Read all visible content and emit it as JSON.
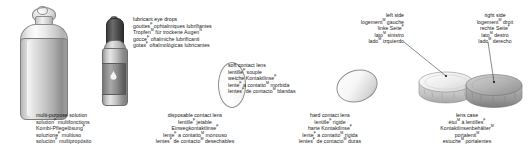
{
  "page": {
    "background": "#ffffff",
    "width": 532,
    "height": 158
  },
  "captions": [
    {
      "id": "multi-purpose-solution",
      "align": "left",
      "lines": [
        {
          "text": "multi-purpose solution",
          "lang": "en"
        },
        {
          "text": "solution",
          "sup": "F",
          "rest": " multifonctions",
          "lang": "fr"
        },
        {
          "text": "Kombi-Pflegelösung",
          "sup": "F",
          "rest": "",
          "lang": "de"
        },
        {
          "text": "soluzione",
          "sup": "F",
          "rest": " multiuso",
          "lang": "it"
        },
        {
          "text": "solución",
          "sup": "F",
          "rest": " multipropósito",
          "lang": "es"
        }
      ]
    },
    {
      "id": "lubricant-eye-drops",
      "align": "left",
      "lines": [
        {
          "text": "lubricant eye drops",
          "lang": "en"
        },
        {
          "text": "gouttes",
          "sup": "F",
          "rest": " ophtalmiques lubrifiantes",
          "lang": "fr"
        },
        {
          "text": "Tropfen",
          "sup": "M",
          "rest": " für trockene Augen",
          "sup2": "N",
          "lang": "de"
        },
        {
          "text": "gocce",
          "sup": "F",
          "rest": " oftalmiche lubrificanti",
          "lang": "it"
        },
        {
          "text": "gotas",
          "sup": "F",
          "rest": " oftalmológicas lubricantes",
          "lang": "es"
        }
      ]
    },
    {
      "id": "soft-contact-lens",
      "align": "left",
      "lines": [
        {
          "text": "soft contact lens",
          "lang": "en"
        },
        {
          "text": "lentille",
          "sup": "F",
          "rest": " souple",
          "lang": "fr"
        },
        {
          "text": "weiche Kontaktlinse",
          "sup": "F",
          "rest": "",
          "lang": "de"
        },
        {
          "text": "lente",
          "sup": "F",
          "rest": " a contatto",
          "sup2": "M",
          "rest2": " morbida",
          "lang": "it"
        },
        {
          "text": "lentes",
          "sup": "F",
          "rest": " de contacto",
          "sup2": "M",
          "rest2": " blandas",
          "lang": "es"
        }
      ]
    },
    {
      "id": "disposable-contact-lens",
      "align": "center",
      "lines": [
        {
          "text": "disposable contact lens",
          "lang": "en"
        },
        {
          "text": "lentille",
          "sup": "F",
          "rest": " jetable",
          "lang": "fr"
        },
        {
          "text": "Einwegkontaktlinse",
          "sup": "F",
          "rest": "",
          "lang": "de"
        },
        {
          "text": "lente",
          "sup": "F",
          "rest": " a contatto",
          "sup2": "M",
          "rest2": " monouso",
          "lang": "it"
        },
        {
          "text": "lentes",
          "sup": "F",
          "rest": " de contacto",
          "sup2": "M",
          "rest2": " desechables",
          "lang": "es"
        }
      ]
    },
    {
      "id": "hard-contact-lens",
      "align": "center",
      "lines": [
        {
          "text": "hard contact lens",
          "lang": "en"
        },
        {
          "text": "lentille",
          "sup": "F",
          "rest": " rigide",
          "lang": "fr"
        },
        {
          "text": "harte Kontaktlinse",
          "sup": "F",
          "rest": "",
          "lang": "de"
        },
        {
          "text": "lente",
          "sup": "F",
          "rest": " a contatto",
          "sup2": "M",
          "rest2": " rigida",
          "lang": "it"
        },
        {
          "text": "lentes",
          "sup": "F",
          "rest": " de contacto",
          "sup2": "M",
          "rest2": " duras",
          "lang": "es"
        }
      ]
    },
    {
      "id": "left-side",
      "align": "right",
      "lines": [
        {
          "text": "left side",
          "lang": "en"
        },
        {
          "text": "logement",
          "sup": "M",
          "rest": " gauche",
          "lang": "fr"
        },
        {
          "text": "linke Seite",
          "sup": "F",
          "rest": "",
          "lang": "de"
        },
        {
          "text": "lato",
          "sup": "M",
          "rest": " sinistro",
          "lang": "it"
        },
        {
          "text": "lado",
          "sup": "M",
          "rest": " izquierdo",
          "lang": "es"
        }
      ]
    },
    {
      "id": "right-side",
      "align": "center",
      "lines": [
        {
          "text": "right side",
          "lang": "en"
        },
        {
          "text": "logement",
          "sup": "M",
          "rest": " droit",
          "lang": "fr"
        },
        {
          "text": "rechte Seite",
          "sup": "F",
          "rest": "",
          "lang": "de"
        },
        {
          "text": "lato",
          "sup": "M",
          "rest": " destro",
          "lang": "it"
        },
        {
          "text": "lado",
          "sup": "M",
          "rest": " derecho",
          "lang": "es"
        }
      ]
    },
    {
      "id": "lens-case",
      "align": "center",
      "lines": [
        {
          "text": "lens case",
          "lang": "en"
        },
        {
          "text": "étui",
          "sup": "M",
          "rest": " à lentilles",
          "sup2": "F",
          "lang": "fr"
        },
        {
          "text": "Kontaktlinsenbehälter",
          "sup": "M",
          "rest": "",
          "lang": "de"
        },
        {
          "text": "portalenti",
          "sup": "M",
          "rest": "",
          "lang": "it"
        },
        {
          "text": "estuche",
          "sup": "M",
          "rest": " portalentes",
          "lang": "es"
        }
      ]
    }
  ],
  "artwork": {
    "bottle_large": "multi-purpose-solution-bottle",
    "bottle_drops": "lubricant-eye-drops-bottle",
    "lens_soft": "soft-contact-lens-illustration",
    "lens_hard": "hard-contact-lens-illustration",
    "lens_case": "lens-case-illustration"
  },
  "colors": {
    "text": "#1c1c1c",
    "background": "#ffffff",
    "leader_line": "#2b2b2b",
    "cap_dark": "#3c3c3c",
    "case_light": "#e3e3e3",
    "case_dark": "#9f9f9f"
  }
}
